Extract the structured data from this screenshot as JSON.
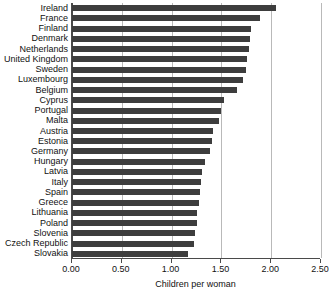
{
  "chart_data": {
    "type": "bar",
    "orientation": "horizontal",
    "title": "",
    "xlabel": "Children per woman",
    "ylabel": "",
    "xlim": [
      0.0,
      2.5
    ],
    "xticks": [
      "0.00",
      "0.50",
      "1.00",
      "1.50",
      "2.00",
      "2.50"
    ],
    "xtick_values": [
      0.0,
      0.5,
      1.0,
      1.5,
      2.0,
      2.5
    ],
    "grid": true,
    "legend": false,
    "bar_color": "#3d3d3d",
    "categories": [
      "Ireland",
      "France",
      "Finland",
      "Denmark",
      "Netherlands",
      "United Kingdom",
      "Sweden",
      "Luxembourg",
      "Belgium",
      "Cyprus",
      "Portugal",
      "Malta",
      "Austria",
      "Estonia",
      "Germany",
      "Hungary",
      "Latvia",
      "Italy",
      "Spain",
      "Greece",
      "Lithuania",
      "Poland",
      "Slovenia",
      "Czech Republic",
      "Slovakia"
    ],
    "values": [
      2.05,
      1.89,
      1.8,
      1.79,
      1.78,
      1.76,
      1.75,
      1.72,
      1.66,
      1.53,
      1.5,
      1.48,
      1.42,
      1.41,
      1.39,
      1.34,
      1.31,
      1.3,
      1.29,
      1.28,
      1.26,
      1.25,
      1.23,
      1.22,
      1.16
    ]
  }
}
